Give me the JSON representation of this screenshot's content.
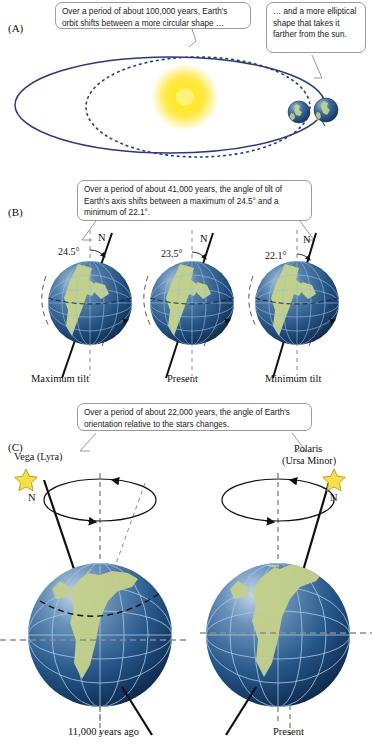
{
  "figure": {
    "background_color": "#ffffff"
  },
  "colors": {
    "orbit_line": "#2b3a7a",
    "sun_core": "#fff27a",
    "sun_glow": "#f5d000",
    "globe_ocean_dark": "#1d3f6e",
    "globe_ocean_light": "#6f8fb8",
    "globe_land": "#c3d08a",
    "star_yellow": "#f5e04a",
    "callout_border": "#9a9a9a",
    "axis_line": "#000000",
    "dashed_gray": "#8a8a8a",
    "text": "#111111"
  },
  "panels": {
    "a": {
      "label": "(A)",
      "callouts": [
        {
          "name": "eccentricity-callout-left",
          "text": "Over a period of about 100,000 years, Earth's orbit shifts between a more circular shape …"
        },
        {
          "name": "eccentricity-callout-right",
          "text": "… and a more elliptical shape that takes it farther from the sun."
        }
      ],
      "objects": {
        "sun": "sun-glyph",
        "orbit_solid": "elliptical-orbit",
        "orbit_dotted": "circular-orbit",
        "earth_inner": "earth-near-sun",
        "earth_outer": "earth-far-from-sun"
      }
    },
    "b": {
      "label": "(B)",
      "callout": {
        "name": "obliquity-callout",
        "text": "Over a period of about 41,000 years, the angle of tilt of Earth's axis shifts between a maximum of 24.5° and a minimum of 22.1°."
      },
      "globes": [
        {
          "name": "globe-maximum-tilt",
          "angle": "24.5°",
          "north_label": "N",
          "caption": "Maximum tilt",
          "tilt_degrees": 24.5
        },
        {
          "name": "globe-present-tilt",
          "angle": "23.5°",
          "north_label": "N",
          "caption": "Present",
          "tilt_degrees": 23.5
        },
        {
          "name": "globe-minimum-tilt",
          "angle": "22.1°",
          "north_label": "N",
          "caption": "Minimum tilt",
          "tilt_degrees": 22.1
        }
      ]
    },
    "c": {
      "label": "(C)",
      "callout": {
        "name": "precession-callout",
        "text": "Over a period of about 22,000 years, the angle of Earth's orientation relative to the stars changes."
      },
      "scenes": [
        {
          "name": "precession-scene-past",
          "star_name": "Vega (Lyra)",
          "star_name_line1": "Vega (Lyra)",
          "star_name_line2": "",
          "north_label": "N",
          "caption": "11,000 years ago"
        },
        {
          "name": "precession-scene-present",
          "star_name": "Polaris (Ursa Minor)",
          "star_name_line1": "Polaris",
          "star_name_line2": "(Ursa Minor)",
          "north_label": "N",
          "caption": "Present"
        }
      ]
    }
  }
}
